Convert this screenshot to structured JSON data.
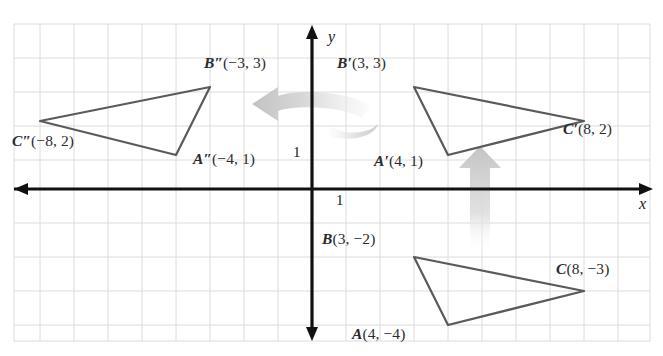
{
  "figure": {
    "type": "coordinate-plane",
    "axis_labels": {
      "x": "x",
      "y": "y"
    },
    "tick_labels": {
      "y_one": "1",
      "x_one": "1"
    },
    "grid": {
      "unit_px": 34,
      "origin_px": [
        312,
        189
      ],
      "visible": true,
      "color": "#d8d8d8"
    },
    "axis_color": "#111111",
    "triangle_color": "#5a5a5a",
    "arrow_color": "#c9c9c9"
  },
  "triangles": [
    {
      "name": "ABC",
      "label_suffix": "",
      "stroke": "#5a5a5a",
      "vertices": [
        {
          "point": "A",
          "label_letter": "A",
          "coords": "(4, −4)",
          "x": 4,
          "y": -4,
          "label_px": [
            352,
            333
          ]
        },
        {
          "point": "B",
          "label_letter": "B",
          "coords": "(3, −2)",
          "x": 3,
          "y": -2,
          "label_px": [
            322,
            238
          ]
        },
        {
          "point": "C",
          "label_letter": "C",
          "coords": "(8, −3)",
          "x": 8,
          "y": -3,
          "label_px": [
            556,
            268
          ]
        }
      ]
    },
    {
      "name": "A'B'C'",
      "label_suffix": "′",
      "stroke": "#5a5a5a",
      "vertices": [
        {
          "point": "A'",
          "label_letter": "A′",
          "coords": "(4, 1)",
          "x": 4,
          "y": 1,
          "label_px": [
            374,
            160
          ]
        },
        {
          "point": "B'",
          "label_letter": "B′",
          "coords": "(3, 3)",
          "x": 3,
          "y": 3,
          "label_px": [
            337,
            62
          ]
        },
        {
          "point": "C'",
          "label_letter": "C′",
          "coords": "(8, 2)",
          "x": 8,
          "y": 2,
          "label_px": [
            563,
            128
          ]
        }
      ]
    },
    {
      "name": "A\"B\"C\"",
      "label_suffix": "″",
      "stroke": "#5a5a5a",
      "vertices": [
        {
          "point": "A\"",
          "label_letter": "A″",
          "coords": "(−4, 1)",
          "x": -4,
          "y": 1,
          "label_px": [
            196,
            158
          ]
        },
        {
          "point": "B\"",
          "label_letter": "B″",
          "coords": "(−3, 3)",
          "x": -3,
          "y": 3,
          "label_px": [
            207,
            62
          ]
        },
        {
          "point": "C\"",
          "label_letter": "C″",
          "coords": "(−8, 2)",
          "x": -8,
          "y": 2,
          "label_px": [
            12,
            140
          ]
        }
      ]
    }
  ],
  "transformation_arrows": [
    {
      "name": "rotation-arrow",
      "kind": "curved-left",
      "color": "#cfcfcf"
    },
    {
      "name": "translation-arrow",
      "kind": "straight-up",
      "color": "#d2d2d2"
    }
  ]
}
